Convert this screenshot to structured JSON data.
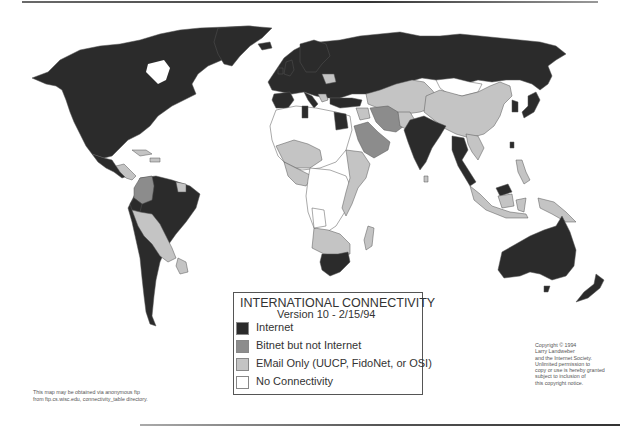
{
  "legend": {
    "title": "INTERNATIONAL CONNECTIVITY",
    "version": "Version 10 - 2/15/94",
    "items": [
      {
        "label": "Internet",
        "color": "#2b2b2b"
      },
      {
        "label": "Bitnet but not Internet",
        "color": "#8c8c8c"
      },
      {
        "label": "EMail Only (UUCP, FidoNet, or OSI)",
        "color": "#c4c4c4"
      },
      {
        "label": "No Connectivity",
        "color": "#ffffff"
      }
    ]
  },
  "copyright": "Copyright © 1994\nLarry Landweber\nand the Internet Society.\nUnlimited permission to\ncopy or use is hereby granted\nsubject to inclusion of\nthis copyright notice.",
  "ftp_note": "This map may be obtained via anonymous ftp\nfrom ftp.cs.wisc.edu, connectivity_table directory.",
  "colors": {
    "internet": "#2b2b2b",
    "bitnet": "#8c8c8c",
    "email": "#c4c4c4",
    "none": "#ffffff",
    "border": "#555555"
  }
}
